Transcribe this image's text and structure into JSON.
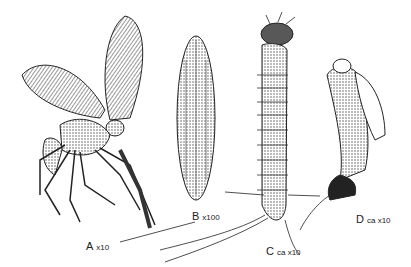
{
  "figure": {
    "labels": [
      {
        "id": "A",
        "letter": "A",
        "magnification": "x10",
        "subject": "adult"
      },
      {
        "id": "B",
        "letter": "B",
        "magnification": "x100",
        "subject": "egg"
      },
      {
        "id": "C",
        "letter": "C",
        "magnification": "ca x10",
        "subject": "larva"
      },
      {
        "id": "D",
        "letter": "D",
        "magnification": "ca x10",
        "subject": "pupa"
      }
    ],
    "colors": {
      "ink": "#222222",
      "background": "#ffffff",
      "shade": "#555555"
    }
  }
}
